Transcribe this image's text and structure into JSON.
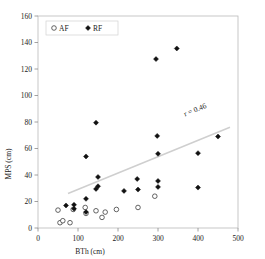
{
  "chart_data": {
    "type": "scatter",
    "title": "",
    "xlabel": "BTh (cm)",
    "ylabel": "MPS (cm)",
    "xlim": [
      0,
      500
    ],
    "ylim": [
      0,
      160
    ],
    "xticks": [
      0,
      100,
      200,
      300,
      400,
      500
    ],
    "yticks": [
      0,
      20,
      40,
      60,
      80,
      100,
      120,
      140,
      160
    ],
    "grid": false,
    "legend_position": "top-left",
    "annotations": [
      {
        "text": "r = 0.46",
        "rotated": true
      }
    ],
    "trendline": {
      "x": [
        75,
        480
      ],
      "y": [
        26,
        76
      ],
      "color": "#cfcfcf"
    },
    "series": [
      {
        "name": "AF",
        "marker": "open-circle",
        "color": "#3d3d3d",
        "points": [
          {
            "x": 50,
            "y": 13.5
          },
          {
            "x": 55,
            "y": 4.0
          },
          {
            "x": 62,
            "y": 5.5
          },
          {
            "x": 80,
            "y": 4.0
          },
          {
            "x": 88,
            "y": 14.0
          },
          {
            "x": 118,
            "y": 15.5
          },
          {
            "x": 120,
            "y": 11.0
          },
          {
            "x": 145,
            "y": 13.0
          },
          {
            "x": 160,
            "y": 8.0
          },
          {
            "x": 168,
            "y": 12.0
          },
          {
            "x": 196,
            "y": 14.0
          },
          {
            "x": 250,
            "y": 15.5
          },
          {
            "x": 292,
            "y": 24.0
          }
        ]
      },
      {
        "name": "RF",
        "marker": "filled-diamond",
        "color": "#111111",
        "points": [
          {
            "x": 70,
            "y": 17.0
          },
          {
            "x": 90,
            "y": 17.5
          },
          {
            "x": 90,
            "y": 14.5
          },
          {
            "x": 120,
            "y": 54.0
          },
          {
            "x": 120,
            "y": 22.0
          },
          {
            "x": 120,
            "y": 12.0
          },
          {
            "x": 145,
            "y": 79.5
          },
          {
            "x": 145,
            "y": 29.5
          },
          {
            "x": 150,
            "y": 38.5
          },
          {
            "x": 150,
            "y": 31.5
          },
          {
            "x": 215,
            "y": 28.0
          },
          {
            "x": 248,
            "y": 37.0
          },
          {
            "x": 250,
            "y": 29.0
          },
          {
            "x": 295,
            "y": 127.5
          },
          {
            "x": 298,
            "y": 69.5
          },
          {
            "x": 300,
            "y": 56.0
          },
          {
            "x": 300,
            "y": 35.5
          },
          {
            "x": 300,
            "y": 31.0
          },
          {
            "x": 347,
            "y": 135.5
          },
          {
            "x": 400,
            "y": 56.5
          },
          {
            "x": 400,
            "y": 30.5
          },
          {
            "x": 450,
            "y": 69.0
          }
        ]
      }
    ]
  },
  "legend": {
    "items": [
      {
        "label": "AF",
        "marker": "open-circle"
      },
      {
        "label": "RF",
        "marker": "filled-diamond"
      }
    ]
  }
}
